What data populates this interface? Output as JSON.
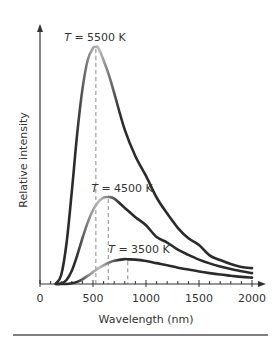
{
  "chart_data": {
    "type": "line",
    "title": "",
    "xlabel": "Wavelength (nm)",
    "ylabel": "Relative intensity",
    "xlim": [
      0,
      2000
    ],
    "ylim": [
      0,
      1.0
    ],
    "x_ticks": [
      0,
      500,
      1000,
      1500,
      2000
    ],
    "x_tick_labels": [
      "0",
      "500",
      "1000",
      "1500",
      "2000"
    ],
    "x_minor_tick_step": 100,
    "y_ticks": [],
    "grid": false,
    "legend": "none (curves labeled inline)",
    "x": [
      150,
      200,
      250,
      300,
      350,
      400,
      450,
      500,
      550,
      600,
      650,
      700,
      800,
      900,
      1000,
      1100,
      1200,
      1300,
      1400,
      1500,
      1600,
      1700,
      1800,
      1900,
      2000
    ],
    "series": [
      {
        "name": "T = 5500 K",
        "temperature_K": 5500,
        "peak_wavelength_nm": 527,
        "peak_value": 1.0,
        "values": [
          0.002,
          0.038,
          0.171,
          0.39,
          0.629,
          0.82,
          0.944,
          0.995,
          0.996,
          0.943,
          0.881,
          0.805,
          0.65,
          0.539,
          0.456,
          0.365,
          0.297,
          0.237,
          0.193,
          0.165,
          0.121,
          0.101,
          0.084,
          0.072,
          0.067
        ]
      },
      {
        "name": "T = 4500 K",
        "temperature_K": 4500,
        "peak_wavelength_nm": 644,
        "peak_value": 0.367,
        "values": [
          0.0,
          0.002,
          0.017,
          0.056,
          0.119,
          0.192,
          0.259,
          0.312,
          0.346,
          0.365,
          0.367,
          0.36,
          0.321,
          0.282,
          0.248,
          0.198,
          0.175,
          0.145,
          0.123,
          0.103,
          0.087,
          0.074,
          0.063,
          0.054,
          0.046
        ]
      },
      {
        "name": "T = 3500 K",
        "temperature_K": 3500,
        "peak_wavelength_nm": 828,
        "peak_value": 0.104,
        "values": [
          0.0,
          0.0,
          0.0,
          0.003,
          0.009,
          0.02,
          0.034,
          0.05,
          0.066,
          0.079,
          0.09,
          0.098,
          0.105,
          0.103,
          0.097,
          0.088,
          0.079,
          0.069,
          0.061,
          0.053,
          0.046,
          0.04,
          0.035,
          0.03,
          0.027
        ]
      }
    ],
    "annotations": [
      {
        "text": "T = 5500 K",
        "x": 527,
        "y": 1.0,
        "note": "dashed drop line at peak wavelength"
      },
      {
        "text": "T = 4500 K",
        "x": 644,
        "y": 0.367,
        "note": "dashed drop line at peak wavelength"
      },
      {
        "text": "T = 3500 K",
        "x": 828,
        "y": 0.104,
        "note": "dashed drop line at peak wavelength"
      }
    ],
    "colors": {
      "curve_dark": "#2b2b2b",
      "curve_light": "#b8b8b8",
      "axis": "#333333",
      "dashed": "#8a8a8a",
      "rule": "#555555"
    }
  },
  "labels": {
    "curve_5500": {
      "var": "T",
      "rest": " = 5500 K"
    },
    "curve_4500": {
      "var": "T",
      "rest": " = 4500 K"
    },
    "curve_3500": {
      "var": "T",
      "rest": " = 3500 K"
    }
  }
}
